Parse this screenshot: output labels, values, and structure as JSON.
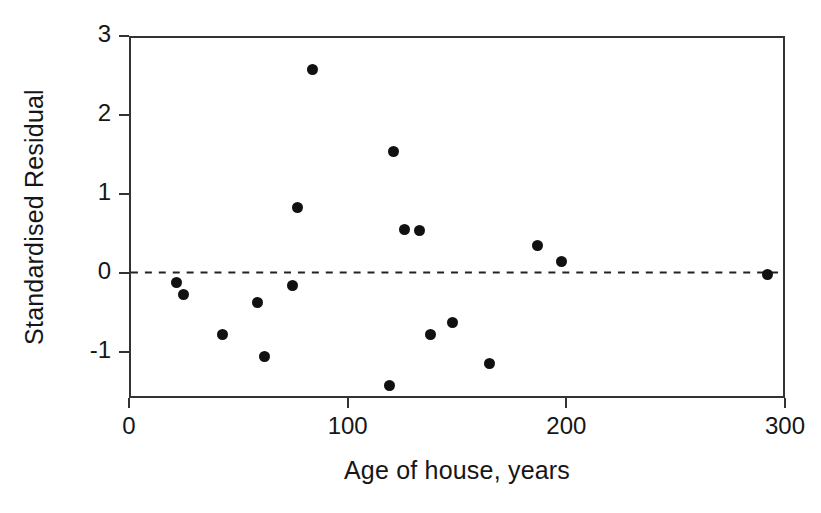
{
  "chart_data": {
    "type": "scatter",
    "title": "",
    "xlabel": "Age of house, years",
    "ylabel": "Standardised Residual",
    "xlim": [
      0,
      300
    ],
    "ylim": [
      -1.58,
      3
    ],
    "xticks": [
      0,
      100,
      200,
      300
    ],
    "xtick_labels": [
      "0",
      "100",
      "200",
      "300"
    ],
    "yticks": [
      -1,
      0,
      1,
      2,
      3
    ],
    "ytick_labels": [
      "-1",
      "0",
      "1",
      "2",
      "3"
    ],
    "grid": false,
    "legend": null,
    "marker": {
      "shape": "circle",
      "filled": true,
      "color": "#111111",
      "size_px": 11
    },
    "reference_line": {
      "orientation": "horizontal",
      "y": 0,
      "style": "dashed",
      "color": "#222222"
    },
    "points": [
      {
        "x": 21,
        "y": -0.09
      },
      {
        "x": 24,
        "y": -0.24
      },
      {
        "x": 42,
        "y": -0.75
      },
      {
        "x": 58,
        "y": -0.35
      },
      {
        "x": 61,
        "y": -1.03
      },
      {
        "x": 74,
        "y": -0.13
      },
      {
        "x": 76,
        "y": 0.86
      },
      {
        "x": 83,
        "y": 2.6
      },
      {
        "x": 118,
        "y": -1.4
      },
      {
        "x": 120,
        "y": 1.56
      },
      {
        "x": 125,
        "y": 0.58
      },
      {
        "x": 132,
        "y": 0.57
      },
      {
        "x": 137,
        "y": -0.75
      },
      {
        "x": 147,
        "y": -0.6
      },
      {
        "x": 164,
        "y": -1.12
      },
      {
        "x": 186,
        "y": 0.37
      },
      {
        "x": 197,
        "y": 0.17
      },
      {
        "x": 291,
        "y": 0.01
      }
    ]
  }
}
